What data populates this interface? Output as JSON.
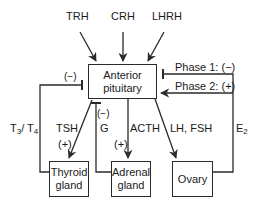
{
  "hormones_top": {
    "trh": "TRH",
    "crh": "CRH",
    "lhrh": "LHRH"
  },
  "boxes": {
    "anterior_pituitary": [
      "Anterior",
      "pituitary"
    ],
    "thyroid_gland": [
      "Thyroid",
      "gland"
    ],
    "adrenal_gland": [
      "Adrenal",
      "gland"
    ],
    "ovary": [
      "Ovary"
    ]
  },
  "labels": {
    "thyroid_feedback_sign": "(−)",
    "t3_t4": {
      "t": "T",
      "s1": "3",
      "sep": "/ T",
      "s2": "4"
    },
    "tsh": "TSH",
    "tsh_sign": "(+)",
    "g_sign": "(−)",
    "g": "G",
    "acth": "ACTH",
    "acth_sign": "(+)",
    "lh_fsh": "LH, FSH",
    "phase1": "Phase 1: (−)",
    "phase2": "Phase 2: (+)",
    "e2": {
      "e": "E",
      "sub": "2"
    }
  },
  "colors": {
    "line": "#2a2a2a",
    "text": "#1a1a1a"
  }
}
